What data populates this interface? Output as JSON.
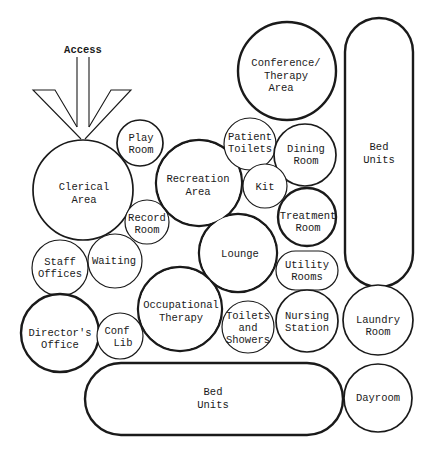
{
  "diagram": {
    "type": "bubble-diagram",
    "access": {
      "label": "Access"
    },
    "rooms": [
      {
        "id": "clerical",
        "lines": [
          "Clerical",
          "Area"
        ]
      },
      {
        "id": "play",
        "lines": [
          "Play",
          "Room"
        ]
      },
      {
        "id": "record",
        "lines": [
          "Record",
          "Room"
        ]
      },
      {
        "id": "recreation",
        "lines": [
          "Recreation",
          "Area"
        ]
      },
      {
        "id": "lounge",
        "lines": [
          "Lounge"
        ]
      },
      {
        "id": "occupational",
        "lines": [
          "Occupational",
          "Therapy"
        ]
      },
      {
        "id": "conference",
        "lines": [
          "Conference/",
          "Therapy",
          "Area"
        ]
      },
      {
        "id": "patient_toilets",
        "lines": [
          "Patient",
          "Toilets"
        ]
      },
      {
        "id": "dining",
        "lines": [
          "Dining",
          "Room"
        ]
      },
      {
        "id": "kit",
        "lines": [
          "Kit"
        ]
      },
      {
        "id": "treatment",
        "lines": [
          "Treatment",
          "Room"
        ]
      },
      {
        "id": "utility",
        "lines": [
          "Utility",
          "Rooms"
        ]
      },
      {
        "id": "nursing",
        "lines": [
          "Nursing",
          "Station"
        ]
      },
      {
        "id": "toilets_showers",
        "lines": [
          "Toilets",
          "and",
          "Showers"
        ]
      },
      {
        "id": "staff",
        "lines": [
          "Staff",
          "Offices"
        ]
      },
      {
        "id": "waiting",
        "lines": [
          "Waiting"
        ]
      },
      {
        "id": "director",
        "lines": [
          "Director's",
          "Office"
        ]
      },
      {
        "id": "conf_lib",
        "lines": [
          "Conf",
          "Lib"
        ]
      },
      {
        "id": "bed_vertical",
        "lines": [
          "Bed",
          "Units"
        ]
      },
      {
        "id": "bed_horizontal",
        "lines": [
          "Bed",
          "Units"
        ]
      },
      {
        "id": "laundry",
        "lines": [
          "Laundry",
          "Room"
        ]
      },
      {
        "id": "dayroom",
        "lines": [
          "Dayroom"
        ]
      }
    ]
  }
}
